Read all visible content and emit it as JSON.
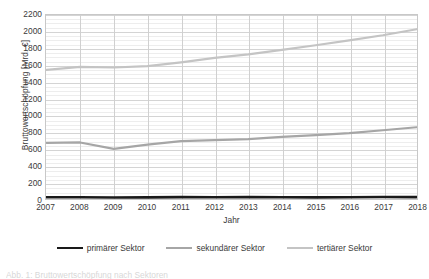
{
  "chart_data": {
    "type": "line",
    "title": "",
    "xlabel": "Jahr",
    "ylabel": "Bruttowertschöpfung [Mrd. €]",
    "categories": [
      2007,
      2008,
      2009,
      2010,
      2011,
      2012,
      2013,
      2014,
      2015,
      2016,
      2017,
      2018
    ],
    "x": [
      "2007",
      "2008",
      "2009",
      "2010",
      "2011",
      "2012",
      "2013",
      "2014",
      "2015",
      "2016",
      "2017",
      "2018"
    ],
    "xlim": [
      2007,
      2018
    ],
    "ylim": [
      0,
      2200
    ],
    "yticks": [
      0,
      200,
      400,
      600,
      800,
      1000,
      1200,
      1400,
      1600,
      1800,
      2000,
      2200
    ],
    "ytick_step": 200,
    "grid": true,
    "minor_grid": true,
    "legend_position": "bottom",
    "series": [
      {
        "name": "primärer Sektor",
        "color": "#1a1a1a",
        "width": 2.6,
        "values": [
          21,
          21,
          18,
          20,
          22,
          21,
          22,
          21,
          20,
          21,
          24,
          23
        ]
      },
      {
        "name": "sekundärer Sektor",
        "color": "#a6a6a6",
        "width": 2.2,
        "values": [
          672,
          676,
          600,
          650,
          692,
          704,
          716,
          742,
          764,
          788,
          822,
          858
        ]
      },
      {
        "name": "tertiärer Sektor",
        "color": "#c4c4c4",
        "width": 2.2,
        "values": [
          1543,
          1580,
          1572,
          1588,
          1634,
          1688,
          1730,
          1784,
          1838,
          1896,
          1958,
          2030
        ]
      }
    ]
  },
  "legend": {
    "items": [
      {
        "label": "primärer Sektor",
        "color": "#1a1a1a",
        "width": 2.6
      },
      {
        "label": "sekundärer Sektor",
        "color": "#a6a6a6",
        "width": 2.2
      },
      {
        "label": "tertiärer Sektor",
        "color": "#c4c4c4",
        "width": 2.2
      }
    ]
  },
  "caption": {
    "text": "Abb. 1: Bruttowertschöpfung nach Sektoren"
  }
}
